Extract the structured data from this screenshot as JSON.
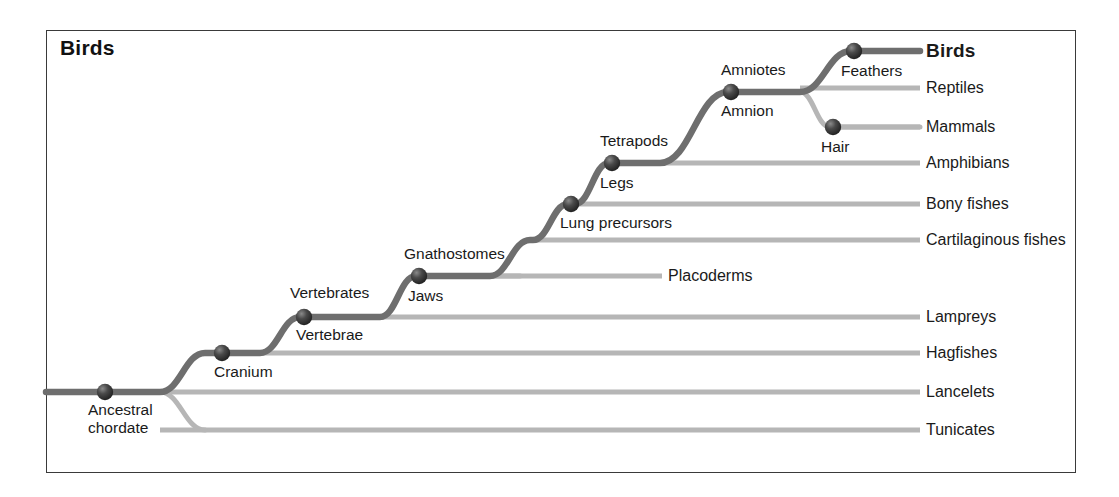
{
  "figure": {
    "corner_title": "Birds",
    "width": 1119,
    "height": 497,
    "frame_color": "#3a3a3a",
    "background": "#ffffff",
    "trunk_color": "#6e6e6e",
    "branch_color": "#b6b6b6",
    "node_color": "#2f2f2f"
  },
  "taxa": [
    {
      "id": "birds",
      "label": "Birds",
      "y": 51,
      "bold": true,
      "line_start_x": 854,
      "line_end_x": 920,
      "style": "trunk"
    },
    {
      "id": "reptiles",
      "label": "Reptiles",
      "y": 88,
      "bold": false,
      "line_start_x": 800,
      "line_end_x": 920,
      "style": "branch"
    },
    {
      "id": "mammals",
      "label": "Mammals",
      "y": 127,
      "bold": false,
      "line_start_x": 833,
      "line_end_x": 920,
      "style": "branch"
    },
    {
      "id": "amphibians",
      "label": "Amphibians",
      "y": 163,
      "bold": false,
      "line_start_x": 612,
      "line_end_x": 920,
      "style": "branch"
    },
    {
      "id": "bony-fishes",
      "label": "Bony fishes",
      "y": 204,
      "bold": false,
      "line_start_x": 571,
      "line_end_x": 920,
      "style": "branch"
    },
    {
      "id": "cartilaginous-fishes",
      "label": "Cartilaginous fishes",
      "y": 240,
      "bold": false,
      "line_start_x": 530,
      "line_end_x": 920,
      "style": "branch"
    },
    {
      "id": "lampreys",
      "label": "Lampreys",
      "y": 317,
      "bold": false,
      "line_start_x": 380,
      "line_end_x": 920,
      "style": "branch"
    },
    {
      "id": "hagfishes",
      "label": "Hagfishes",
      "y": 353,
      "bold": false,
      "line_start_x": 260,
      "line_end_x": 920,
      "style": "branch"
    },
    {
      "id": "lancelets",
      "label": "Lancelets",
      "y": 392,
      "bold": false,
      "line_start_x": 160,
      "line_end_x": 920,
      "style": "branch"
    },
    {
      "id": "tunicates",
      "label": "Tunicates",
      "y": 430,
      "bold": false,
      "line_start_x": 160,
      "line_end_x": 920,
      "style": "branch"
    },
    {
      "id": "placoderms",
      "label": "Placoderms",
      "y": 276,
      "bold": false,
      "line_start_x": 490,
      "line_end_x": 662,
      "style": "branch",
      "label_x": 668
    }
  ],
  "nodes": [
    {
      "id": "ancestral-chordate",
      "clade": "",
      "trait": "Ancestral\nchordate",
      "x": 105,
      "y": 392
    },
    {
      "id": "cranium",
      "clade": "",
      "trait": "Cranium",
      "x": 222,
      "y": 353
    },
    {
      "id": "vertebrates",
      "clade": "Vertebrates",
      "trait": "Vertebrae",
      "x": 304,
      "y": 317
    },
    {
      "id": "gnathostomes",
      "clade": "Gnathostomes",
      "trait": "Jaws",
      "x": 419,
      "y": 276
    },
    {
      "id": "lung-precursors",
      "clade": "",
      "trait": "Lung precursors",
      "x": 571,
      "y": 204
    },
    {
      "id": "tetrapods",
      "clade": "Tetrapods",
      "trait": "Legs",
      "x": 612,
      "y": 163
    },
    {
      "id": "amniotes",
      "clade": "Amniotes",
      "trait": "Amnion",
      "x": 731,
      "y": 92
    },
    {
      "id": "feathers",
      "clade": "",
      "trait": "Feathers",
      "x": 854,
      "y": 51
    },
    {
      "id": "hair",
      "clade": "",
      "trait": "Hair",
      "x": 833,
      "y": 127
    }
  ],
  "node_labels": [
    {
      "id": "label-ancestral-chordate",
      "text": "Ancestral",
      "x": 88,
      "y": 401
    },
    {
      "id": "label-ancestral-chordate-2",
      "text": "chordate",
      "x": 88,
      "y": 419
    },
    {
      "id": "label-cranium",
      "text": "Cranium",
      "x": 214,
      "y": 363
    },
    {
      "id": "label-vertebrates",
      "text": "Vertebrates",
      "x": 290,
      "y": 284
    },
    {
      "id": "label-vertebrae",
      "text": "Vertebrae",
      "x": 296,
      "y": 326
    },
    {
      "id": "label-gnathostomes",
      "text": "Gnathostomes",
      "x": 404,
      "y": 245
    },
    {
      "id": "label-jaws",
      "text": "Jaws",
      "x": 408,
      "y": 287
    },
    {
      "id": "label-lung-precursors",
      "text": "Lung precursors",
      "x": 560,
      "y": 214
    },
    {
      "id": "label-tetrapods",
      "text": "Tetrapods",
      "x": 600,
      "y": 132
    },
    {
      "id": "label-legs",
      "text": "Legs",
      "x": 600,
      "y": 174
    },
    {
      "id": "label-amniotes",
      "text": "Amniotes",
      "x": 721,
      "y": 61
    },
    {
      "id": "label-amnion",
      "text": "Amnion",
      "x": 721,
      "y": 102
    },
    {
      "id": "label-feathers",
      "text": "Feathers",
      "x": 841,
      "y": 62
    },
    {
      "id": "label-hair",
      "text": "Hair",
      "x": 821,
      "y": 138
    }
  ],
  "taxon_label_x": 926
}
